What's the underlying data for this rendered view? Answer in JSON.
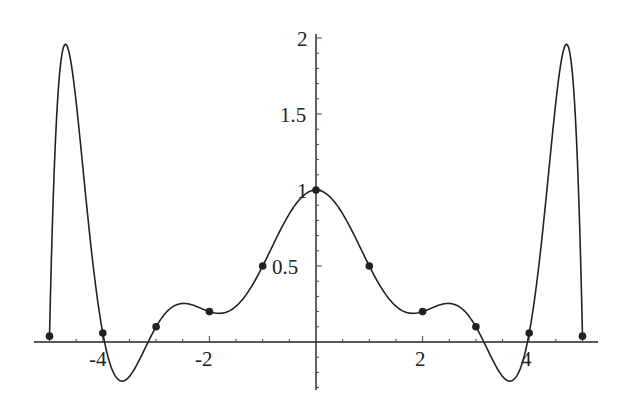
{
  "chart_data": {
    "type": "line",
    "title": "",
    "xlabel": "",
    "ylabel": "",
    "xlim": [
      -5.3,
      5.3
    ],
    "ylim": [
      -0.3,
      2.0
    ],
    "x_ticks": [
      -4,
      -2,
      2,
      4
    ],
    "x_tick_labels": [
      "-4",
      "-2",
      "2",
      "4"
    ],
    "y_ticks": [
      0.5,
      1,
      1.5,
      2
    ],
    "y_tick_labels": [
      "0.5",
      "1",
      "1.5",
      "2"
    ],
    "grid": false,
    "legend": null,
    "series": [
      {
        "name": "interpolation nodes",
        "type": "scatter",
        "x": [
          -5,
          -4,
          -3,
          -2,
          -1,
          0,
          1,
          2,
          3,
          4,
          5
        ],
        "y": [
          0.0385,
          0.0588,
          0.1,
          0.2,
          0.5,
          1.0,
          0.5,
          0.2,
          0.1,
          0.0588,
          0.0385
        ]
      },
      {
        "name": "interpolating polynomial P10(x)",
        "type": "line",
        "peaks": [
          {
            "x": -4.5,
            "y": 1.9
          },
          {
            "x": 4.5,
            "y": 1.9
          }
        ],
        "troughs": [
          {
            "x": -3.6,
            "y": -0.3
          },
          {
            "x": 3.6,
            "y": -0.3
          }
        ]
      }
    ]
  },
  "colors": {
    "ink": "#222222",
    "background": "#ffffff"
  }
}
